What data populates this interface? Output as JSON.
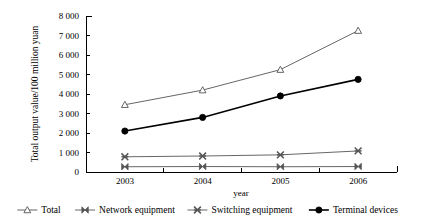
{
  "chart_data": {
    "type": "line",
    "title": "",
    "subtitle": "",
    "xlabel": "year",
    "ylabel": "Total output value/100 million yuan",
    "categories": [
      "2003",
      "2004",
      "2005",
      "2006"
    ],
    "x": [
      2003,
      2004,
      2005,
      2006
    ],
    "xlim": [
      2002.5,
      2006.5
    ],
    "ylim": [
      0,
      8000
    ],
    "ytick_labels": [
      "0",
      "1 000",
      "2 000",
      "3 000",
      "4 000",
      "5 000",
      "6 000",
      "7 000",
      "8 000"
    ],
    "ytick_values": [
      0,
      1000,
      2000,
      3000,
      4000,
      5000,
      6000,
      7000,
      8000
    ],
    "grid": false,
    "legend_position": "bottom",
    "series": [
      {
        "name": "Total",
        "marker": "open-triangle",
        "color": "#555555",
        "values": [
          3450,
          4200,
          5250,
          7250
        ]
      },
      {
        "name": "Network equipment",
        "marker": "bowtie",
        "color": "#555555",
        "values": [
          270,
          280,
          270,
          280
        ]
      },
      {
        "name": "Switching equipment",
        "marker": "asterisk",
        "color": "#555555",
        "values": [
          780,
          820,
          880,
          1080
        ]
      },
      {
        "name": "Terminal devices",
        "marker": "filled-circle",
        "color": "#000000",
        "values": [
          2100,
          2800,
          3900,
          4750
        ]
      }
    ]
  }
}
